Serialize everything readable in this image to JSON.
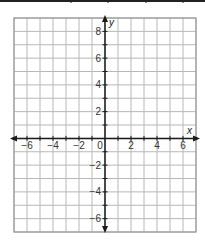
{
  "chart_data": {
    "type": "scatter",
    "title": "",
    "xlabel": "x",
    "ylabel": "y",
    "xlim": [
      -7,
      7
    ],
    "ylim": [
      -7,
      9
    ],
    "grid": true,
    "grid_step": 1,
    "x_ticks": [
      -6,
      -4,
      -2,
      0,
      2,
      4,
      6
    ],
    "x_tick_labels": [
      "−6",
      "−4",
      "−2",
      "0",
      "2",
      "4",
      "6"
    ],
    "y_ticks": [
      8,
      6,
      4,
      2,
      -2,
      -4,
      -6
    ],
    "y_tick_labels": [
      "8",
      "6",
      "4",
      "2",
      "−2",
      "−4",
      "−6"
    ],
    "series": [],
    "legend": null
  },
  "colors": {
    "grid": "#b8b8b8",
    "border": "#9a9a9a",
    "axis": "#1a1a1a",
    "table_border": "#222222"
  },
  "table_stub": {
    "dividers_x": [
      71,
      108,
      146,
      183
    ]
  }
}
